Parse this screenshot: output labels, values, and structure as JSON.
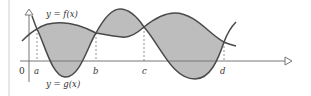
{
  "diagram": {
    "curve_f_label": "y = f(x)",
    "curve_g_label": "y = g(x)",
    "origin_label": "0",
    "x_points": [
      {
        "name": "a",
        "label": "a"
      },
      {
        "name": "b",
        "label": "b"
      },
      {
        "name": "c",
        "label": "c"
      },
      {
        "name": "d",
        "label": "d"
      }
    ],
    "colors": {
      "curve": "#4a4a4a",
      "fill": "#bdbdbd",
      "axis": "#777777",
      "dashed": "#777777"
    }
  }
}
